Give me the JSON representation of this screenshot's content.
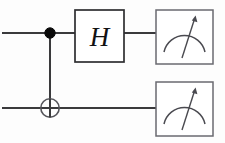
{
  "diagram": {
    "type": "quantum-circuit",
    "canvas": {
      "width": 225,
      "height": 143,
      "background": "#fdfdfd"
    },
    "colors": {
      "wire": "#3a3a3c",
      "control_dot": "#0a0a0a",
      "target_outline": "#55555a",
      "gate_border": "#2e2e31",
      "meter_border": "#6a6a70",
      "meter_ink": "#4a4a50",
      "gate_text": "#111113"
    },
    "wires": [
      {
        "name": "top-qubit-wire",
        "y": 33,
        "x_start": 2,
        "x_end": 223
      },
      {
        "name": "bottom-qubit-wire",
        "y": 108,
        "x_start": 2,
        "x_end": 223
      }
    ],
    "gates": [
      {
        "id": "cnot",
        "label": "CNOT",
        "control": {
          "x": 50,
          "y": 33,
          "radius": 5.2
        },
        "target": {
          "x": 50,
          "y": 108,
          "radius": 9.2
        },
        "link": {
          "x": 50,
          "y_top": 33,
          "y_bottom": 108
        }
      },
      {
        "id": "hadamard",
        "label": "H",
        "box": {
          "x": 75,
          "y": 10,
          "width": 49,
          "height": 52
        }
      }
    ],
    "meters": [
      {
        "id": "measure-top",
        "label": "measurement-meter",
        "box": {
          "x": 156,
          "y": 10,
          "width": 57,
          "height": 54
        },
        "wire_y": 33
      },
      {
        "id": "measure-bottom",
        "label": "measurement-meter",
        "box": {
          "x": 156,
          "y": 82,
          "width": 57,
          "height": 54
        },
        "wire_y": 108
      }
    ],
    "segments": [
      {
        "name": "top-wire-in",
        "from_x": 2,
        "to_x": 75,
        "y": 33
      },
      {
        "name": "top-wire-h-to-meter",
        "from_x": 124,
        "to_x": 156,
        "y": 33
      },
      {
        "name": "bottom-wire-full",
        "from_x": 2,
        "to_x": 156,
        "y": 108
      }
    ]
  }
}
